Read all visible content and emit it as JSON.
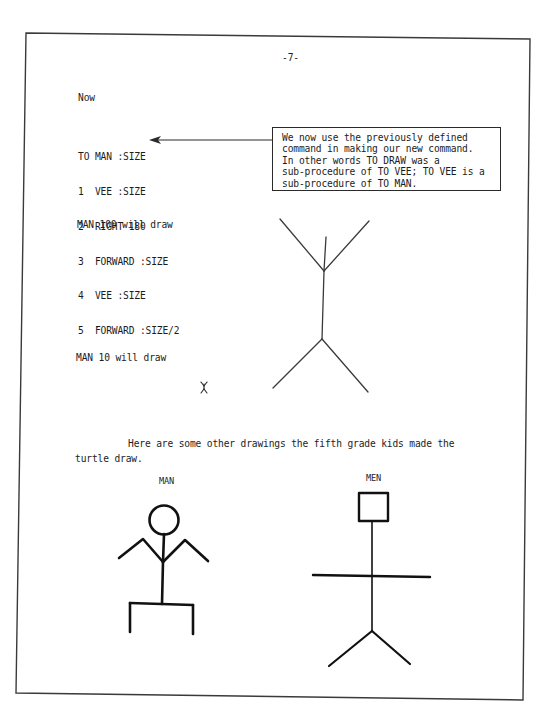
{
  "page": {
    "page_number": "-7-",
    "intro": "Now",
    "procedure": {
      "header": "TO MAN :SIZE",
      "lines": [
        {
          "num": "1",
          "cmd": "VEE :SIZE"
        },
        {
          "num": "2",
          "cmd": "RIGHT 180"
        },
        {
          "num": "3",
          "cmd": "FORWARD :SIZE"
        },
        {
          "num": "4",
          "cmd": "VEE :SIZE"
        },
        {
          "num": "5",
          "cmd": "FORWARD :SIZE/2"
        }
      ]
    },
    "callout": {
      "lines": [
        "We now use the previously defined",
        "command in making our new command.",
        "In other words TO DRAW was a",
        "sub-procedure of TO VEE; TO VEE is a",
        "sub-procedure of TO MAN."
      ]
    },
    "example_large": {
      "caption": "MAN 100 will draw",
      "figure": "large stick figure (two VEE shapes joined by a body line)"
    },
    "example_small": {
      "caption": "MAN 10 will draw",
      "figure": "tiny stick figure"
    },
    "paragraph": {
      "line1": "Here are some other drawings the fifth grade kids made the",
      "line2": "turtle draw."
    },
    "kid_drawings": [
      {
        "label": "MAN",
        "figure": "stick figure with circle head, bent arms, table-shaped legs"
      },
      {
        "label": "MEN",
        "figure": "stick figure with square head, straight horizontal arms, V legs"
      }
    ]
  }
}
